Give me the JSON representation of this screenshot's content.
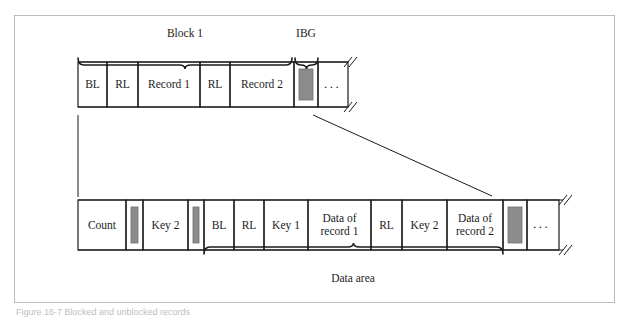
{
  "figure": {
    "caption": "Figure 16-7 Blocked and unblocked records",
    "frame_color": "#b9bcc0",
    "line_color": "#1b1b1b",
    "gray_block_fill": "#8c8c8c",
    "background": "#ffffff"
  },
  "top_row": {
    "name": "blocked-records-row",
    "braces": [
      {
        "id": "block1",
        "label": "Block 1",
        "x1": 78,
        "x2": 292,
        "label_x": 185,
        "label_y": 27
      },
      {
        "id": "ibg",
        "label": "IBG",
        "x1": 295,
        "x2": 318,
        "label_x": 306,
        "label_y": 27
      }
    ],
    "cells": [
      {
        "id": "bl",
        "label": "BL",
        "x": 78,
        "w": 29,
        "shaded": false
      },
      {
        "id": "rl-1",
        "label": "RL",
        "x": 107,
        "w": 31,
        "shaded": false
      },
      {
        "id": "record-1",
        "label": "Record 1",
        "x": 138,
        "w": 62,
        "shaded": false
      },
      {
        "id": "rl-2",
        "label": "RL",
        "x": 200,
        "w": 30,
        "shaded": false
      },
      {
        "id": "record-2",
        "label": "Record 2",
        "x": 230,
        "w": 64,
        "shaded": false
      },
      {
        "id": "ibg-gap",
        "label": "",
        "x": 294,
        "w": 24,
        "shaded": true
      },
      {
        "id": "ellipsis",
        "label": "...",
        "x": 318,
        "w": 30,
        "shaded": false
      }
    ],
    "y": 62,
    "h": 45,
    "break_x": 348,
    "ellipsis": "..."
  },
  "bottom_row": {
    "name": "count-key-data-row",
    "cells": [
      {
        "id": "count",
        "label": "Count",
        "x": 78,
        "w": 48,
        "shaded": false
      },
      {
        "id": "gap-1",
        "label": "",
        "x": 126,
        "w": 17,
        "shaded": true
      },
      {
        "id": "key-2-a",
        "label": "Key 2",
        "x": 143,
        "w": 45,
        "shaded": false
      },
      {
        "id": "gap-2",
        "label": "",
        "x": 188,
        "w": 16,
        "shaded": true
      },
      {
        "id": "bl",
        "label": "BL",
        "x": 204,
        "w": 30,
        "shaded": false
      },
      {
        "id": "rl-1",
        "label": "RL",
        "x": 234,
        "w": 30,
        "shaded": false
      },
      {
        "id": "key-1",
        "label": "Key 1",
        "x": 264,
        "w": 44,
        "shaded": false
      },
      {
        "id": "data-of-record-1",
        "label": "Data of\nrecord 1",
        "x": 308,
        "w": 63,
        "shaded": false
      },
      {
        "id": "rl-2",
        "label": "RL",
        "x": 371,
        "w": 31,
        "shaded": false
      },
      {
        "id": "key-2-b",
        "label": "Key 2",
        "x": 402,
        "w": 45,
        "shaded": false
      },
      {
        "id": "data-of-record-2",
        "label": "Data of\nrecord 2",
        "x": 447,
        "w": 56,
        "shaded": false
      },
      {
        "id": "gap-3",
        "label": "",
        "x": 503,
        "w": 24,
        "shaded": true
      },
      {
        "id": "ellipsis",
        "label": "...",
        "x": 527,
        "w": 32,
        "shaded": false
      }
    ],
    "y": 200,
    "h": 50,
    "break_x": 563,
    "ellipsis": "...",
    "brace": {
      "id": "data-area",
      "label": "Data area",
      "x1": 204,
      "x2": 503,
      "label_x": 353,
      "label_y": 272
    }
  },
  "connectors": {
    "vertical_line": {
      "x": 78,
      "y1": 115,
      "y2": 197
    },
    "diagonal_line": {
      "x1": 313,
      "y1": 115,
      "x2": 492,
      "y2": 196
    }
  }
}
